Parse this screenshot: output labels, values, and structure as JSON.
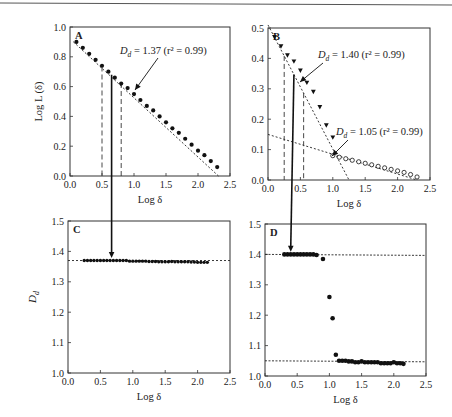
{
  "chart_data": [
    {
      "panel": "A",
      "type": "scatter",
      "xlabel": "Log δ",
      "ylabel": "Log L (δ)",
      "xlim": [
        0.0,
        2.5
      ],
      "ylim": [
        0.0,
        1.0
      ],
      "xticks": [
        "0.0",
        "0.5",
        "1.0",
        "1.5",
        "2.0",
        "2.5"
      ],
      "yticks": [
        "0.0",
        "0.2",
        "0.4",
        "0.6",
        "0.8",
        "1.0"
      ],
      "annotation": "D_d = 1.37 (r² = 0.99)",
      "fit": {
        "slope": -0.37,
        "intercept": 0.92
      },
      "series": [
        {
          "name": "data",
          "marker": "filled-circle",
          "x": [
            0.1,
            0.2,
            0.3,
            0.4,
            0.5,
            0.6,
            0.7,
            0.8,
            0.9,
            1.0,
            1.1,
            1.2,
            1.3,
            1.4,
            1.5,
            1.6,
            1.7,
            1.8,
            1.9,
            2.0,
            2.1,
            2.2,
            2.3
          ],
          "y": [
            0.9,
            0.86,
            0.82,
            0.78,
            0.74,
            0.7,
            0.66,
            0.62,
            0.59,
            0.55,
            0.51,
            0.47,
            0.44,
            0.4,
            0.36,
            0.32,
            0.29,
            0.25,
            0.21,
            0.17,
            0.14,
            0.1,
            0.06
          ]
        }
      ],
      "dashed_verticals": [
        0.5,
        0.8
      ],
      "solid_vertical": 0.65
    },
    {
      "panel": "B",
      "type": "scatter",
      "xlabel": "Log δ",
      "ylabel": "",
      "xlim": [
        0.0,
        2.5
      ],
      "ylim": [
        0.0,
        0.5
      ],
      "xticks": [
        "0.0",
        "0.5",
        "1.0",
        "1.5",
        "2.0",
        "2.5"
      ],
      "yticks": [
        "0.0",
        "0.1",
        "0.2",
        "0.3",
        "0.4",
        "0.5"
      ],
      "annotations": [
        "D_d = 1.40 (r² = 0.99)",
        "D_d = 1.05 (r² = 0.99)"
      ],
      "series": [
        {
          "name": "steep region",
          "marker": "filled-triangle",
          "x": [
            0.1,
            0.2,
            0.3,
            0.4,
            0.5,
            0.6,
            0.7,
            0.8,
            0.9,
            1.0
          ],
          "y": [
            0.47,
            0.44,
            0.41,
            0.39,
            0.36,
            0.32,
            0.29,
            0.24,
            0.18,
            0.14
          ]
        },
        {
          "name": "shallow region",
          "marker": "open-circle",
          "x": [
            1.0,
            1.1,
            1.2,
            1.3,
            1.4,
            1.5,
            1.6,
            1.7,
            1.8,
            1.9,
            2.0,
            2.1,
            2.2,
            2.3
          ],
          "y": [
            0.08,
            0.075,
            0.07,
            0.065,
            0.06,
            0.055,
            0.05,
            0.045,
            0.04,
            0.035,
            0.03,
            0.025,
            0.018,
            0.01
          ]
        }
      ],
      "fit_lines": [
        {
          "label": "1.40",
          "x0": 0.0,
          "y0": 0.51,
          "x1": 1.25,
          "y1": 0.0
        },
        {
          "label": "1.05",
          "x0": 0.0,
          "y0": 0.15,
          "x1": 2.3,
          "y1": 0.0
        }
      ],
      "dashed_verticals": [
        0.25,
        0.55
      ],
      "solid_vertical": 0.4
    },
    {
      "panel": "C",
      "type": "scatter",
      "xlabel": "Log δ",
      "ylabel": "D_d",
      "xlim": [
        0.0,
        2.5
      ],
      "ylim": [
        1.0,
        1.5
      ],
      "xticks": [
        "0.0",
        "0.5",
        "1.0",
        "1.5",
        "2.0",
        "2.5"
      ],
      "yticks": [
        "1.0",
        "1.1",
        "1.2",
        "1.3",
        "1.4",
        "1.5"
      ],
      "reference_line": 1.37,
      "series": [
        {
          "name": "D_d",
          "marker": "filled-circle",
          "x": [
            0.25,
            0.3,
            0.35,
            0.4,
            0.45,
            0.5,
            0.55,
            0.6,
            0.65,
            0.7,
            0.75,
            0.8,
            0.85,
            0.9,
            0.95,
            1.0,
            1.05,
            1.1,
            1.15,
            1.2,
            1.25,
            1.3,
            1.35,
            1.4,
            1.45,
            1.5,
            1.55,
            1.6,
            1.65,
            1.7,
            1.75,
            1.8,
            1.85,
            1.9,
            1.95,
            2.0,
            2.05,
            2.1,
            2.15
          ],
          "y": [
            1.37,
            1.37,
            1.37,
            1.37,
            1.37,
            1.37,
            1.37,
            1.37,
            1.37,
            1.37,
            1.37,
            1.37,
            1.37,
            1.37,
            1.368,
            1.368,
            1.368,
            1.368,
            1.368,
            1.368,
            1.367,
            1.367,
            1.367,
            1.366,
            1.366,
            1.366,
            1.366,
            1.367,
            1.366,
            1.366,
            1.366,
            1.366,
            1.366,
            1.365,
            1.365,
            1.364,
            1.364,
            1.364,
            1.364
          ]
        }
      ],
      "arrow_x": 0.65
    },
    {
      "panel": "D",
      "type": "scatter",
      "xlabel": "Log δ",
      "ylabel": "",
      "xlim": [
        0.0,
        2.5
      ],
      "ylim": [
        1.0,
        1.5
      ],
      "xticks": [
        "0.0",
        "0.5",
        "1.0",
        "1.5",
        "2.0",
        "2.5"
      ],
      "yticks": [
        "1.0",
        "1.1",
        "1.2",
        "1.3",
        "1.4",
        "1.5"
      ],
      "reference_lines": [
        1.4,
        1.05
      ],
      "series": [
        {
          "name": "D_d",
          "marker": "filled-circle",
          "x": [
            0.3,
            0.35,
            0.4,
            0.45,
            0.5,
            0.55,
            0.6,
            0.65,
            0.7,
            0.75,
            0.8,
            0.9,
            1.0,
            1.05,
            1.1,
            1.15,
            1.2,
            1.25,
            1.3,
            1.35,
            1.4,
            1.45,
            1.5,
            1.55,
            1.6,
            1.65,
            1.7,
            1.75,
            1.8,
            1.85,
            1.9,
            1.95,
            2.0,
            2.05,
            2.1,
            2.15
          ],
          "y": [
            1.4,
            1.4,
            1.4,
            1.4,
            1.4,
            1.4,
            1.4,
            1.4,
            1.4,
            1.4,
            1.398,
            1.385,
            1.26,
            1.19,
            1.07,
            1.05,
            1.05,
            1.05,
            1.048,
            1.048,
            1.045,
            1.045,
            1.048,
            1.045,
            1.045,
            1.045,
            1.045,
            1.045,
            1.042,
            1.042,
            1.042,
            1.042,
            1.045,
            1.042,
            1.042,
            1.04
          ]
        }
      ],
      "arrow_x": 0.4
    }
  ],
  "panels": {
    "A": {
      "letter": "A",
      "xlabel": "Log δ",
      "ylabel": "Log L (δ)",
      "annotation": "= 1.37 (r² = 0.99)"
    },
    "B": {
      "letter": "B",
      "xlabel": "Log δ",
      "annotation1": "= 1.40 (r² = 0.99)",
      "annotation2": "= 1.05 (r² = 0.99)"
    },
    "C": {
      "letter": "C",
      "xlabel": "Log δ",
      "ylabel": "D"
    },
    "D": {
      "letter": "D",
      "xlabel": "Log δ"
    }
  }
}
